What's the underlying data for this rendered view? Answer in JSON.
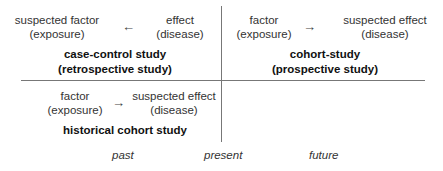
{
  "quadrants": {
    "top_left": {
      "left_node": {
        "line1": "suspected factor",
        "line2": "(exposure)"
      },
      "arrow": "←",
      "right_node": {
        "line1": "effect",
        "line2": "(disease)"
      },
      "title": {
        "line1": "case-control study",
        "line2": "(retrospective study)"
      }
    },
    "top_right": {
      "left_node": {
        "line1": "factor",
        "line2": "(exposure)"
      },
      "arrow": "→",
      "right_node": {
        "line1": "suspected effect",
        "line2": "(disease)"
      },
      "title": {
        "line1": "cohort-study",
        "line2": "(prospective study)"
      }
    },
    "bottom_left": {
      "left_node": {
        "line1": "factor",
        "line2": "(exposure)"
      },
      "arrow": "→",
      "right_node": {
        "line1": "suspected effect",
        "line2": "(disease)"
      },
      "title": {
        "line1": "historical cohort study"
      }
    }
  },
  "timeline": {
    "past": "past",
    "present": "present",
    "future": "future"
  }
}
